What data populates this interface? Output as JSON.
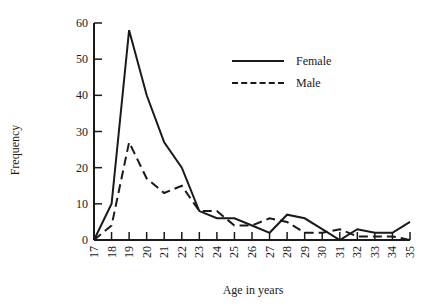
{
  "chart_data": {
    "type": "line",
    "title": "",
    "xlabel": "Age in years",
    "ylabel": "Frequency",
    "x": [
      17,
      18,
      19,
      20,
      21,
      22,
      23,
      24,
      25,
      26,
      27,
      28,
      29,
      30,
      31,
      32,
      33,
      34,
      35
    ],
    "series": [
      {
        "name": "Female",
        "style": "solid",
        "values": [
          0,
          10,
          58,
          40,
          27,
          20,
          8,
          6,
          6,
          4,
          2,
          7,
          6,
          3,
          0,
          3,
          2,
          2,
          5
        ]
      },
      {
        "name": "Male",
        "style": "dashed",
        "values": [
          0,
          4,
          27,
          17,
          13,
          15,
          8,
          8,
          4,
          4,
          6,
          5,
          2,
          2,
          3,
          1,
          1,
          1,
          0
        ]
      }
    ],
    "yticks": [
      0,
      10,
      20,
      30,
      40,
      50,
      60
    ],
    "xticks": [
      "17",
      "18",
      "19",
      "20",
      "21",
      "22",
      "23",
      "24",
      "25",
      "26",
      "27",
      "28",
      "29",
      "30",
      "31",
      "32",
      "33",
      "34",
      "35"
    ],
    "ylim": [
      0,
      60
    ],
    "xlim": [
      17,
      35
    ],
    "grid": false,
    "legend_position": "upper right",
    "color": "#1a1a1a"
  },
  "labels": {
    "xlabel": "Age in years",
    "ylabel": "Frequency",
    "legend_female": "Female",
    "legend_male": "Male"
  }
}
